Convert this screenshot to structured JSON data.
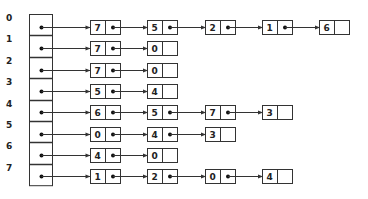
{
  "diagram": {
    "title": "",
    "type": "adjacency-list",
    "colors": {
      "stroke": "#333333",
      "background": "#ffffff",
      "text": "#222222"
    },
    "index_column": {
      "x": 29,
      "width": 23,
      "top": 14,
      "row_height": 21.4
    },
    "node_layout": {
      "first_x": 90,
      "spacing": 57.3,
      "width": 30,
      "height": 14,
      "value_cell_width": 15
    },
    "rows": [
      {
        "index": "0",
        "nodes": [
          "7",
          "5",
          "2",
          "1",
          "6"
        ]
      },
      {
        "index": "1",
        "nodes": [
          "7",
          "0"
        ]
      },
      {
        "index": "2",
        "nodes": [
          "7",
          "0"
        ]
      },
      {
        "index": "3",
        "nodes": [
          "5",
          "4"
        ]
      },
      {
        "index": "4",
        "nodes": [
          "6",
          "5",
          "7",
          "3"
        ]
      },
      {
        "index": "5",
        "nodes": [
          "0",
          "4",
          "3"
        ]
      },
      {
        "index": "6",
        "nodes": [
          "4",
          "0"
        ]
      },
      {
        "index": "7",
        "nodes": [
          "1",
          "2",
          "0",
          "4"
        ]
      }
    ]
  }
}
